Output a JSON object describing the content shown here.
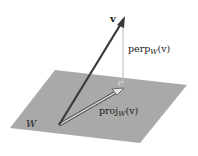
{
  "diagram": {
    "labels": {
      "vector": "v",
      "perp_main": "perp",
      "perp_sub": "W",
      "perp_arg": "(v)",
      "proj_main": "proj",
      "proj_sub": "W",
      "proj_arg": "(v)",
      "plane": "W"
    },
    "colors": {
      "plane": "#a9a9a9",
      "vector": "#3a3a3a",
      "perp_line": "#b0b0b0",
      "proj_outline": "#555555",
      "background": "#ffffff"
    }
  }
}
